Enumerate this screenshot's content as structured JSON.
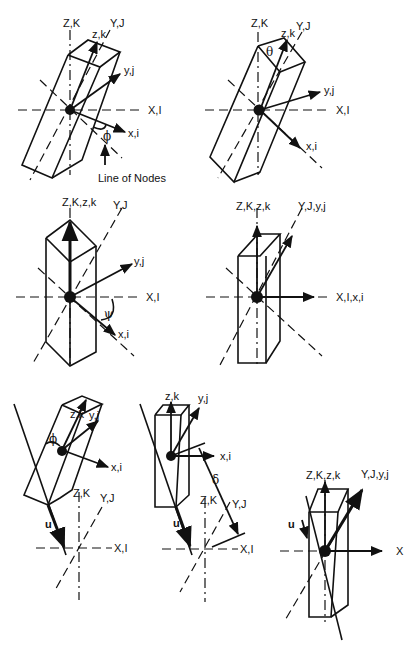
{
  "figure": {
    "panels": [
      {
        "id": "panel-1",
        "labels": {
          "Z": "Z,K",
          "Y": "Y,J",
          "X": "X,I",
          "z": "z,k",
          "y": "y,j",
          "x": "x,i",
          "angle": "ϕ",
          "note": "Line of Nodes"
        }
      },
      {
        "id": "panel-2",
        "labels": {
          "Z": "Z,K",
          "Y": "Y,J",
          "X": "X,I",
          "z": "z,k",
          "y": "y,j",
          "x": "x,i",
          "angle": "θ"
        }
      },
      {
        "id": "panel-3",
        "labels": {
          "Z": "Z,K,z,k",
          "Y": "Y,J",
          "X": "X,I",
          "y": "y,j",
          "x": "x,i",
          "angle": "ψ"
        }
      },
      {
        "id": "panel-4",
        "labels": {
          "Z": "Z,K,z,k",
          "Y": "Y,J,y,j",
          "X": "X,I,x,i"
        }
      },
      {
        "id": "panel-5",
        "labels": {
          "z": "z,k",
          "y": "y,j",
          "x": "x,i",
          "angle": "ϕ",
          "Z": "Z,K",
          "Y": "Y,J",
          "X": "X,I",
          "u": "u"
        }
      },
      {
        "id": "panel-6",
        "labels": {
          "z": "z,k",
          "y": "y,j",
          "x": "x,i",
          "angle": "δ",
          "Z": "Z,K",
          "Y": "Y,J",
          "X": "X,I",
          "u": "u"
        }
      },
      {
        "id": "panel-7",
        "labels": {
          "Z": "Z,K,z,k",
          "Y": "Y,J,y,j",
          "X": "X",
          "u": "u"
        }
      }
    ]
  }
}
